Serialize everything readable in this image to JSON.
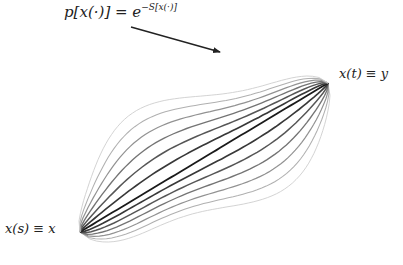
{
  "diagram": {
    "formula": {
      "lhs": "p[x(·)] = e",
      "exponent": "−S[x(·)]"
    },
    "start_label": "x(s) ≡ x",
    "end_label": "x(t) ≡ y",
    "start_point": [
      80,
      232
    ],
    "end_point": [
      328,
      83
    ],
    "arrow": {
      "from": [
        131,
        27
      ],
      "to": [
        220,
        52
      ]
    },
    "path_count": 13,
    "colors": {
      "center": "#1a1a1a",
      "outer": "#cfcfcf",
      "arrow": "#222222",
      "text": "#222222"
    }
  }
}
